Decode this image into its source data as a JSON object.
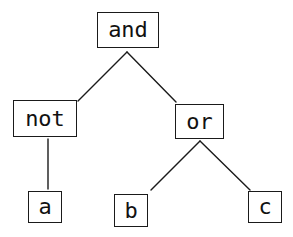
{
  "diagram": {
    "type": "expression-tree",
    "nodes": [
      {
        "id": "and",
        "label": "and",
        "x": 97,
        "y": 12,
        "w": 62,
        "h": 36
      },
      {
        "id": "not",
        "label": "not",
        "x": 13,
        "y": 100,
        "w": 64,
        "h": 37
      },
      {
        "id": "or",
        "label": "or",
        "x": 175,
        "y": 104,
        "w": 49,
        "h": 35
      },
      {
        "id": "a",
        "label": "a",
        "x": 28,
        "y": 191,
        "w": 34,
        "h": 32
      },
      {
        "id": "b",
        "label": "b",
        "x": 114,
        "y": 194,
        "w": 34,
        "h": 33
      },
      {
        "id": "c",
        "label": "c",
        "x": 248,
        "y": 191,
        "w": 34,
        "h": 32
      }
    ],
    "edges": [
      {
        "from": "and",
        "to": "not",
        "x1": 127,
        "y1": 52,
        "x2": 78,
        "y2": 101
      },
      {
        "from": "and",
        "to": "or",
        "x1": 127,
        "y1": 52,
        "x2": 176,
        "y2": 102
      },
      {
        "from": "not",
        "to": "a",
        "x1": 48,
        "y1": 139,
        "x2": 48,
        "y2": 189
      },
      {
        "from": "or",
        "to": "b",
        "x1": 200,
        "y1": 141,
        "x2": 151,
        "y2": 190
      },
      {
        "from": "or",
        "to": "c",
        "x1": 200,
        "y1": 141,
        "x2": 250,
        "y2": 190
      }
    ]
  }
}
